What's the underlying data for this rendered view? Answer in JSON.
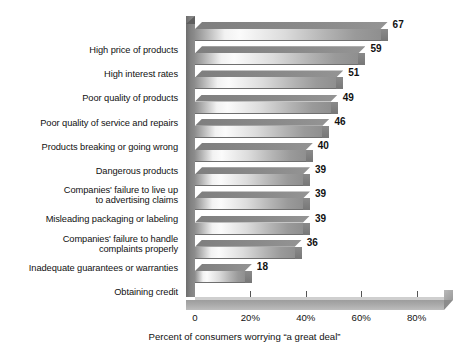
{
  "chart_data": {
    "type": "bar",
    "orientation": "horizontal",
    "title": "",
    "xlabel": "Percent of consumers worrying “a great deal”",
    "ylabel": "",
    "xlim": [
      0,
      90
    ],
    "grid": false,
    "legend": null,
    "xtick_labels": [
      "0",
      "20%",
      "40%",
      "60%",
      "80%"
    ],
    "xtick_values": [
      0,
      20,
      40,
      60,
      80
    ],
    "categories": [
      "High price of products",
      "High interest rates",
      "Poor quality of products",
      "Poor quality of service and repairs",
      "Products breaking or going wrong",
      "Dangerous products",
      "Companies' failure to live up\nto advertising claims",
      "Misleading packaging or labeling",
      "Companies' failure to handle\ncomplaints properly",
      "Inadequate guarantees or warranties",
      "Obtaining credit"
    ],
    "values": [
      67,
      59,
      51,
      49,
      46,
      40,
      39,
      39,
      39,
      36,
      18
    ],
    "value_labels": [
      "67",
      "59",
      "51",
      "49",
      "46",
      "40",
      "39",
      "39",
      "39",
      "36",
      "18"
    ],
    "colors": {
      "bar_front_light": "#fbfbfb",
      "bar_front_dark": "#8e8e8e",
      "bar_top": "#7a7a7a",
      "axis": "#808080",
      "floor": "#a8a8a8",
      "text": "#111111",
      "background": "#ffffff"
    }
  }
}
